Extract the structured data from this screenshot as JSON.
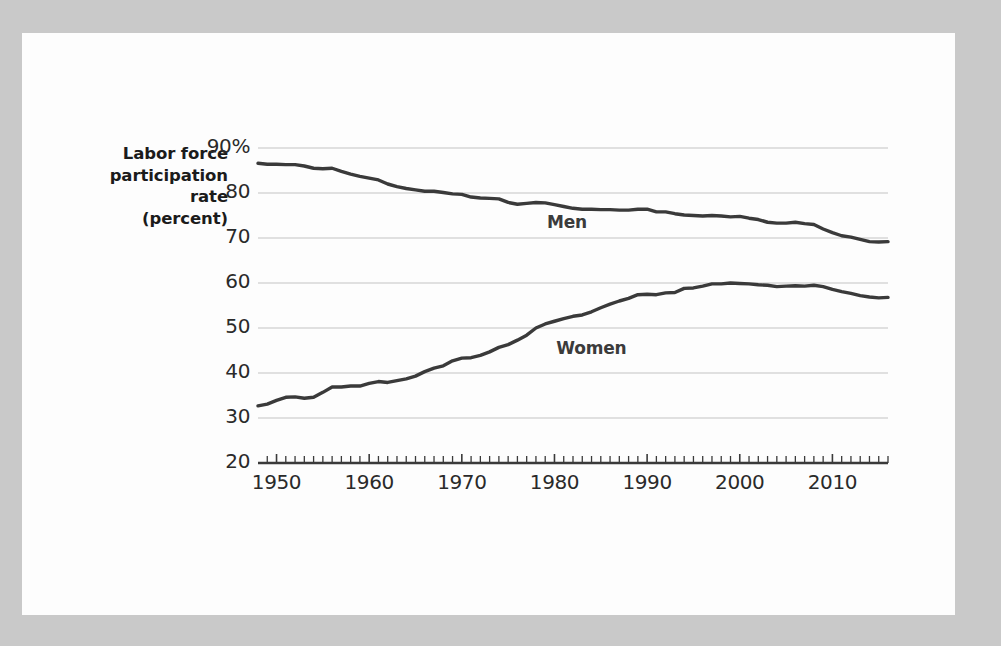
{
  "chart_data": {
    "type": "line",
    "title": "",
    "subtitle": "",
    "ylabel": "Labor force participation rate (percent)",
    "ylabel_lines": [
      "Labor force",
      "participation",
      "rate",
      "(percent)"
    ],
    "xlabel": "",
    "xlim": [
      1948,
      2016
    ],
    "ylim": [
      20,
      90
    ],
    "grid": true,
    "grid_axis": "y",
    "legend_position": "inline-annotations",
    "y_ticks": [
      90,
      80,
      70,
      60,
      50,
      40,
      30,
      20
    ],
    "y_tick_labels": [
      "90%",
      "80",
      "70",
      "60",
      "50",
      "40",
      "30",
      "20"
    ],
    "x_ticks": [
      1950,
      1960,
      1970,
      1980,
      1990,
      2000,
      2010
    ],
    "x_tick_labels": [
      "1950",
      "1960",
      "1970",
      "1980",
      "1990",
      "2000",
      "2010"
    ],
    "x_minor_tick_interval": 1,
    "line_color": "#3a3a3a",
    "grid_color": "#c4c4c4",
    "axis_color": "#3a3a3a",
    "background_color": "#fdfdfd",
    "page_background_color": "#c9c9c9",
    "annotations": [
      {
        "text": "Men",
        "x": 1982,
        "y": 73.5
      },
      {
        "text": "Women",
        "x": 1983,
        "y": 45.5
      }
    ],
    "series": [
      {
        "name": "Men",
        "label": "Men",
        "color": "#3a3a3a",
        "x": [
          1948,
          1949,
          1950,
          1951,
          1952,
          1953,
          1954,
          1955,
          1956,
          1957,
          1958,
          1959,
          1960,
          1961,
          1962,
          1963,
          1964,
          1965,
          1966,
          1967,
          1968,
          1969,
          1970,
          1971,
          1972,
          1973,
          1974,
          1975,
          1976,
          1977,
          1978,
          1979,
          1980,
          1981,
          1982,
          1983,
          1984,
          1985,
          1986,
          1987,
          1988,
          1989,
          1990,
          1991,
          1992,
          1993,
          1994,
          1995,
          1996,
          1997,
          1998,
          1999,
          2000,
          2001,
          2002,
          2003,
          2004,
          2005,
          2006,
          2007,
          2008,
          2009,
          2010,
          2011,
          2012,
          2013,
          2014,
          2015,
          2016
        ],
        "values": [
          86.6,
          86.4,
          86.4,
          86.3,
          86.3,
          86.0,
          85.5,
          85.4,
          85.5,
          84.8,
          84.2,
          83.7,
          83.3,
          82.9,
          82.0,
          81.4,
          81.0,
          80.7,
          80.4,
          80.4,
          80.1,
          79.8,
          79.7,
          79.1,
          78.9,
          78.8,
          78.7,
          77.9,
          77.5,
          77.7,
          77.9,
          77.8,
          77.4,
          77.0,
          76.6,
          76.4,
          76.4,
          76.3,
          76.3,
          76.2,
          76.2,
          76.4,
          76.4,
          75.8,
          75.8,
          75.4,
          75.1,
          75.0,
          74.9,
          75.0,
          74.9,
          74.7,
          74.8,
          74.4,
          74.1,
          73.5,
          73.3,
          73.3,
          73.5,
          73.2,
          73.0,
          72.0,
          71.2,
          70.5,
          70.2,
          69.7,
          69.2,
          69.1,
          69.2
        ]
      },
      {
        "name": "Women",
        "label": "Women",
        "color": "#3a3a3a",
        "x": [
          1948,
          1949,
          1950,
          1951,
          1952,
          1953,
          1954,
          1955,
          1956,
          1957,
          1958,
          1959,
          1960,
          1961,
          1962,
          1963,
          1964,
          1965,
          1966,
          1967,
          1968,
          1969,
          1970,
          1971,
          1972,
          1973,
          1974,
          1975,
          1976,
          1977,
          1978,
          1979,
          1980,
          1981,
          1982,
          1983,
          1984,
          1985,
          1986,
          1987,
          1988,
          1989,
          1990,
          1991,
          1992,
          1993,
          1994,
          1995,
          1996,
          1997,
          1998,
          1999,
          2000,
          2001,
          2002,
          2003,
          2004,
          2005,
          2006,
          2007,
          2008,
          2009,
          2010,
          2011,
          2012,
          2013,
          2014,
          2015,
          2016
        ],
        "values": [
          32.7,
          33.1,
          33.9,
          34.6,
          34.7,
          34.4,
          34.6,
          35.7,
          36.9,
          36.9,
          37.1,
          37.1,
          37.7,
          38.1,
          37.9,
          38.3,
          38.7,
          39.3,
          40.3,
          41.1,
          41.6,
          42.7,
          43.3,
          43.4,
          43.9,
          44.7,
          45.7,
          46.3,
          47.3,
          48.4,
          50.0,
          50.9,
          51.5,
          52.1,
          52.6,
          52.9,
          53.6,
          54.5,
          55.3,
          56.0,
          56.6,
          57.4,
          57.5,
          57.4,
          57.8,
          57.9,
          58.8,
          58.9,
          59.3,
          59.8,
          59.8,
          60.0,
          59.9,
          59.8,
          59.6,
          59.5,
          59.2,
          59.3,
          59.4,
          59.3,
          59.5,
          59.2,
          58.6,
          58.1,
          57.7,
          57.2,
          56.9,
          56.7,
          56.8
        ]
      }
    ]
  }
}
